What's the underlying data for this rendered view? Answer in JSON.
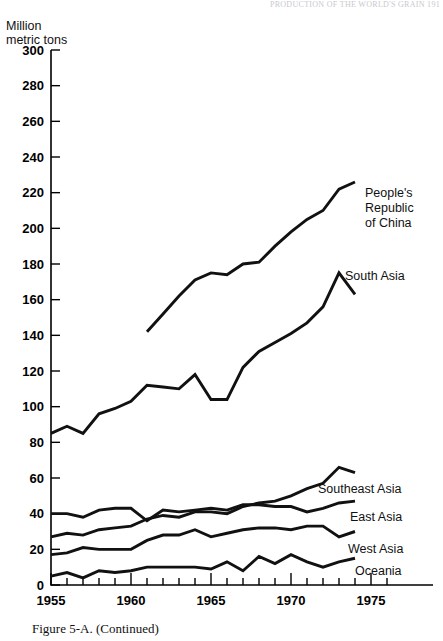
{
  "page_header": "PRODUCTION OF THE WORLD'S GRAIN   191",
  "axis_title": "Million\nmetric tons",
  "caption": "Figure 5-A. (Continued)",
  "chart_data": {
    "type": "line",
    "title": "",
    "subtitle": "",
    "xlabel": "",
    "ylabel": "Million metric tons",
    "xlim": [
      1955,
      1976
    ],
    "ylim": [
      0,
      300
    ],
    "ytick_step": 20,
    "yticks": [
      0,
      20,
      40,
      60,
      80,
      100,
      120,
      140,
      160,
      180,
      200,
      220,
      240,
      260,
      280,
      300
    ],
    "xticks": [
      1955,
      1960,
      1965,
      1970,
      1975
    ],
    "xtick_minor_interval": 1,
    "grid": false,
    "legend": "inline-right-labels",
    "line_color": "#111111",
    "series": [
      {
        "name": "People's Republic of China",
        "label": "People's\nRepublic\nof China",
        "x": [
          1961,
          1962,
          1963,
          1964,
          1965,
          1966,
          1967,
          1968,
          1969,
          1970,
          1971,
          1972,
          1973,
          1974
        ],
        "values": [
          142,
          152,
          162,
          171,
          175,
          174,
          180,
          181,
          190,
          198,
          205,
          210,
          222,
          226
        ]
      },
      {
        "name": "South Asia",
        "label": "South Asia",
        "x": [
          1955,
          1956,
          1957,
          1958,
          1959,
          1960,
          1961,
          1962,
          1963,
          1964,
          1965,
          1966,
          1967,
          1968,
          1969,
          1970,
          1971,
          1972,
          1973,
          1974
        ],
        "values": [
          85,
          89,
          85,
          96,
          99,
          103,
          112,
          111,
          110,
          118,
          104,
          104,
          122,
          131,
          136,
          141,
          147,
          156,
          175,
          163
        ]
      },
      {
        "name": "Southeast Asia",
        "label": "Southeast Asia",
        "x": [
          1955,
          1956,
          1957,
          1958,
          1959,
          1960,
          1961,
          1962,
          1963,
          1964,
          1965,
          1966,
          1967,
          1968,
          1969,
          1970,
          1971,
          1972,
          1973,
          1974
        ],
        "values": [
          27,
          29,
          28,
          31,
          32,
          33,
          37,
          39,
          38,
          41,
          41,
          40,
          44,
          46,
          47,
          50,
          54,
          57,
          66,
          63
        ]
      },
      {
        "name": "East Asia",
        "label": "East Asia",
        "x": [
          1955,
          1956,
          1957,
          1958,
          1959,
          1960,
          1961,
          1962,
          1963,
          1964,
          1965,
          1966,
          1967,
          1968,
          1969,
          1970,
          1971,
          1972,
          1973,
          1974
        ],
        "values": [
          40,
          40,
          38,
          42,
          43,
          43,
          36,
          42,
          41,
          42,
          43,
          42,
          45,
          45,
          44,
          44,
          41,
          43,
          46,
          47
        ]
      },
      {
        "name": "West Asia",
        "label": "West Asia",
        "x": [
          1955,
          1956,
          1957,
          1958,
          1959,
          1960,
          1961,
          1962,
          1963,
          1964,
          1965,
          1966,
          1967,
          1968,
          1969,
          1970,
          1971,
          1972,
          1973,
          1974
        ],
        "values": [
          17,
          18,
          21,
          20,
          20,
          20,
          25,
          28,
          28,
          31,
          27,
          29,
          31,
          32,
          32,
          31,
          33,
          33,
          27,
          30
        ]
      },
      {
        "name": "Oceania",
        "label": "Oceania",
        "x": [
          1955,
          1956,
          1957,
          1958,
          1959,
          1960,
          1961,
          1962,
          1963,
          1964,
          1965,
          1966,
          1967,
          1968,
          1969,
          1970,
          1971,
          1972,
          1973,
          1974
        ],
        "values": [
          5,
          7,
          4,
          8,
          7,
          8,
          10,
          10,
          10,
          10,
          9,
          13,
          8,
          16,
          12,
          17,
          13,
          10,
          13,
          15
        ]
      }
    ],
    "series_label_positions": [
      {
        "name": "People's Republic of China",
        "x": 365,
        "y": 197
      },
      {
        "name": "South Asia",
        "x": 345,
        "y": 280
      },
      {
        "name": "Southeast Asia",
        "x": 318,
        "y": 493
      },
      {
        "name": "East Asia",
        "x": 350,
        "y": 521
      },
      {
        "name": "West Asia",
        "x": 348,
        "y": 553
      },
      {
        "name": "Oceania",
        "x": 355,
        "y": 575
      }
    ]
  }
}
